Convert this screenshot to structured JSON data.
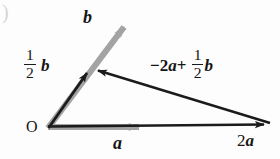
{
  "figure": {
    "background_color": "#fdfdfd",
    "width": 280,
    "height": 159,
    "corner_mark": ")"
  },
  "colors": {
    "black": "#1b1b1b",
    "gray": "#9a9a9a",
    "gray_light": "#b0b0b0",
    "label": "#151515"
  },
  "labels": {
    "origin": "O",
    "b": "b",
    "a": "a",
    "two_a": "2a",
    "half_b_numerator": "1",
    "half_b_denominator": "2",
    "half_b_vector": "b",
    "combination_lead": "−2",
    "combination_a": "a",
    "combination_plus": "+",
    "combination_numerator": "1",
    "combination_denominator": "2",
    "combination_b": "b"
  },
  "vectors": [
    {
      "name": "b",
      "label": "b",
      "color": "#9a9a9a",
      "style": "gray",
      "from": [
        48,
        128
      ],
      "to": [
        129,
        21
      ]
    },
    {
      "name": "half-b",
      "label": "1/2 b",
      "color": "#1b1b1b",
      "style": "black",
      "from": [
        48,
        128
      ],
      "to": [
        90,
        67
      ]
    },
    {
      "name": "a",
      "label": "a",
      "color": "#9a9a9a",
      "style": "gray",
      "from": [
        48,
        127
      ],
      "to": [
        146,
        127
      ]
    },
    {
      "name": "two-a",
      "label": "2a",
      "color": "#1b1b1b",
      "style": "black",
      "from": [
        48,
        126
      ],
      "to": [
        272,
        124
      ]
    },
    {
      "name": "minus-two-a-plus-half-b",
      "label": "-2a + 1/2 b",
      "color": "#1b1b1b",
      "style": "black",
      "from": [
        270,
        123
      ],
      "to": [
        90,
        68
      ]
    }
  ]
}
